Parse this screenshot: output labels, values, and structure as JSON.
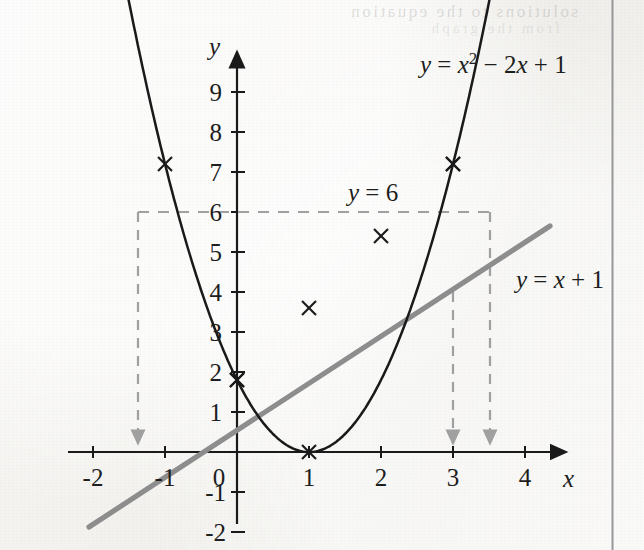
{
  "figure": {
    "kind": "mathematics-textbook-graph",
    "background_color": "#f2f1ee",
    "curve_color": "#1a1a1a",
    "line_color": "#8d8d8d",
    "dashed_color": "#a0a0a0",
    "axis_color": "#1a1a1a",
    "page_rule_color": "#87878a",
    "bleed_text": "solutions to the equation",
    "bleed_text_2": "from the graph"
  },
  "axes": {
    "x_label": "x",
    "y_label": "y",
    "x_ticks": [
      "-2",
      "-1",
      "0",
      "1",
      "2",
      "3",
      "4"
    ],
    "x_tick_values": [
      -2,
      -1,
      0,
      1,
      2,
      3,
      4
    ],
    "y_ticks": [
      "9",
      "8",
      "7",
      "6",
      "5",
      "4",
      "3",
      "2",
      "1",
      "-1",
      "-2"
    ],
    "y_tick_values": [
      9,
      8,
      7,
      6,
      5,
      4,
      3,
      2,
      1,
      -1,
      -2
    ],
    "origin_label": "0",
    "xlim": [
      -2.35,
      4.55
    ],
    "ylim": [
      -2.2,
      9.6
    ],
    "arrowheads": [
      "x-positive",
      "y-positive"
    ]
  },
  "chart_data": {
    "type": "line",
    "title": "",
    "xlabel": "x",
    "ylabel": "y",
    "xlim": [
      -2.35,
      4.55
    ],
    "ylim": [
      -2.2,
      9.6
    ],
    "grid": false,
    "legend": "inline-curve-labels",
    "series": [
      {
        "name": "y = x2 - 2x + 1",
        "label": "y = x² − 2x + 1",
        "color": "#1a1a1a",
        "style": "solid-curve",
        "width": 2.4,
        "x": [
          -2,
          -1.75,
          -1.5,
          -1.25,
          -1,
          -0.75,
          -0.5,
          -0.25,
          0,
          0.25,
          0.5,
          0.75,
          1,
          1.25,
          1.5,
          1.75,
          2,
          2.25,
          2.5,
          2.75,
          3,
          3.25,
          3.5,
          3.75,
          4
        ],
        "y": [
          9,
          7.5625,
          6.25,
          5.0625,
          4,
          3.0625,
          2.25,
          1.5625,
          1,
          0.5625,
          0.25,
          0.0625,
          0,
          0.0625,
          0.25,
          0.5625,
          1,
          1.5625,
          2.25,
          3.0625,
          4,
          5.0625,
          6.25,
          7.5625,
          9
        ],
        "markers": [
          {
            "x": -2,
            "y": 9
          },
          {
            "x": -1,
            "y": 4
          },
          {
            "x": 0,
            "y": 1
          },
          {
            "x": 1,
            "y": 0
          },
          {
            "x": 3,
            "y": 4
          },
          {
            "x": 4,
            "y": 9
          }
        ],
        "marker_style": "cross"
      },
      {
        "name": "y = x + 1",
        "label": "y = x + 1",
        "color": "#8d8d8d",
        "style": "solid-line",
        "width": 5,
        "x": [
          -2.05,
          4.35
        ],
        "y": [
          -1.05,
          5.35
        ],
        "markers": [
          {
            "x": 0,
            "y": 1
          },
          {
            "x": 1,
            "y": 2
          },
          {
            "x": 2,
            "y": 3
          },
          {
            "x": 3,
            "y": 4
          }
        ],
        "marker_style": "cross"
      },
      {
        "name": "y = 6",
        "label": "y = 6",
        "color": "#a0a0a0",
        "style": "dashed-horizontal",
        "width": 2,
        "y_value": 6,
        "x_from": -1.37,
        "x_to": 3.52
      }
    ],
    "annotations": [
      {
        "text": "y = x² − 2x + 1",
        "x": 2.55,
        "y": 9.6,
        "name": "parabola-equation-label"
      },
      {
        "text": "y = x + 1",
        "x": 4.0,
        "y": 4.1,
        "name": "line-equation-label"
      },
      {
        "text": "y = 6",
        "x": 1.55,
        "y": 6.55,
        "name": "y-equals-6-label"
      }
    ],
    "drop_arrows": [
      {
        "name": "drop-arrow-left-roots",
        "x": -1.37,
        "from_y": 6,
        "to_y": 0
      },
      {
        "name": "drop-arrow-intersection-x3",
        "x": 3.0,
        "from_y": 4,
        "to_y": 0
      },
      {
        "name": "drop-arrow-right-roots",
        "x": 3.52,
        "from_y": 6,
        "to_y": 0
      }
    ],
    "intersections": [
      {
        "x": 0,
        "y": 1
      },
      {
        "x": 3,
        "y": 4
      }
    ]
  }
}
